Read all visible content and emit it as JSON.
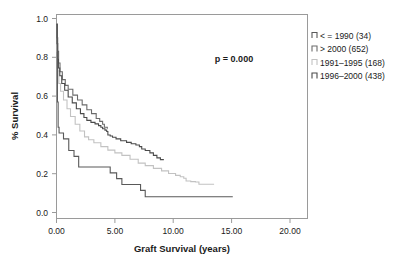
{
  "chart_data": {
    "type": "line",
    "subtype": "kaplan-meier-survival",
    "title": "",
    "xlabel": "Graft Survival (years)",
    "ylabel": "% Survival",
    "xlim": [
      0,
      21.5
    ],
    "ylim": [
      0,
      1.05
    ],
    "xticks": [
      0,
      5,
      10,
      15,
      20
    ],
    "xtick_labels": [
      "0.00",
      "5.00",
      "10.00",
      "15.00",
      "20.00"
    ],
    "yticks": [
      0.0,
      0.2,
      0.4,
      0.6,
      0.8,
      1.0
    ],
    "ytick_labels": [
      "0.0",
      "0.2",
      "0.4",
      "0.6",
      "0.8",
      "1.0"
    ],
    "grid": false,
    "legend_position": "right-outside",
    "annotations": [
      {
        "name": "p-value",
        "text": "p = 0.000",
        "x": 11.0,
        "y": 0.8
      }
    ],
    "series": [
      {
        "name": "<= 1990 (34)",
        "label": "< = 1990 (34)",
        "group": "<= 1990",
        "n": 34,
        "color": "#595959",
        "points": [
          [
            0.0,
            1.0
          ],
          [
            0.08,
            0.6
          ],
          [
            0.14,
            0.47
          ],
          [
            0.22,
            0.44
          ],
          [
            0.55,
            0.44
          ],
          [
            0.6,
            0.41
          ],
          [
            1.0,
            0.41
          ],
          [
            1.05,
            0.35
          ],
          [
            1.45,
            0.35
          ],
          [
            1.5,
            0.32
          ],
          [
            1.85,
            0.32
          ],
          [
            1.9,
            0.265
          ],
          [
            4.55,
            0.265
          ],
          [
            4.6,
            0.235
          ],
          [
            5.1,
            0.235
          ],
          [
            5.15,
            0.205
          ],
          [
            5.55,
            0.205
          ],
          [
            5.6,
            0.175
          ],
          [
            7.15,
            0.175
          ],
          [
            7.2,
            0.145
          ],
          [
            7.55,
            0.145
          ],
          [
            7.6,
            0.112
          ],
          [
            15.1,
            0.112
          ]
        ]
      },
      {
        "name": "> 2000 (652)",
        "label": "> 2000 (652)",
        "group": "> 2000",
        "n": 652,
        "color": "#6b6b6b",
        "points": [
          [
            0.0,
            1.0
          ],
          [
            0.05,
            0.93
          ],
          [
            0.1,
            0.86
          ],
          [
            0.18,
            0.8
          ],
          [
            0.3,
            0.755
          ],
          [
            0.5,
            0.715
          ],
          [
            0.75,
            0.685
          ],
          [
            1.0,
            0.665
          ],
          [
            1.4,
            0.635
          ],
          [
            1.8,
            0.61
          ],
          [
            2.2,
            0.585
          ],
          [
            2.6,
            0.56
          ],
          [
            3.0,
            0.54
          ],
          [
            3.4,
            0.515
          ],
          [
            3.7,
            0.5
          ],
          [
            3.95,
            0.485
          ],
          [
            4.1,
            0.47
          ],
          [
            4.35,
            0.462
          ]
        ]
      },
      {
        "name": "1991-1995 (168)",
        "label": "1991–1995 (168)",
        "group": "1991-1995",
        "n": 168,
        "color": "#c2c2c2",
        "points": [
          [
            0.0,
            1.0
          ],
          [
            0.06,
            0.86
          ],
          [
            0.12,
            0.76
          ],
          [
            0.2,
            0.695
          ],
          [
            0.35,
            0.655
          ],
          [
            0.6,
            0.61
          ],
          [
            0.9,
            0.565
          ],
          [
            1.2,
            0.525
          ],
          [
            1.6,
            0.485
          ],
          [
            2.0,
            0.45
          ],
          [
            2.4,
            0.42
          ],
          [
            2.75,
            0.405
          ],
          [
            3.2,
            0.39
          ],
          [
            3.8,
            0.37
          ],
          [
            4.4,
            0.352
          ],
          [
            5.0,
            0.338
          ],
          [
            5.6,
            0.325
          ],
          [
            6.3,
            0.305
          ],
          [
            7.0,
            0.285
          ],
          [
            7.6,
            0.272
          ],
          [
            8.3,
            0.258
          ],
          [
            9.0,
            0.245
          ],
          [
            9.6,
            0.232
          ],
          [
            10.2,
            0.222
          ],
          [
            10.6,
            0.215
          ],
          [
            10.9,
            0.207
          ],
          [
            11.1,
            0.193
          ],
          [
            11.5,
            0.19
          ],
          [
            11.9,
            0.188
          ],
          [
            12.2,
            0.176
          ],
          [
            13.5,
            0.176
          ]
        ]
      },
      {
        "name": "1996-2000 (438)",
        "label": "1996–2000 (438)",
        "group": "1996-2000",
        "n": 438,
        "color": "#4a4a4a",
        "points": [
          [
            0.0,
            1.0
          ],
          [
            0.05,
            0.9
          ],
          [
            0.1,
            0.82
          ],
          [
            0.16,
            0.775
          ],
          [
            0.28,
            0.735
          ],
          [
            0.45,
            0.695
          ],
          [
            0.7,
            0.66
          ],
          [
            1.0,
            0.625
          ],
          [
            1.35,
            0.595
          ],
          [
            1.7,
            0.565
          ],
          [
            2.05,
            0.54
          ],
          [
            2.35,
            0.52
          ],
          [
            2.6,
            0.505
          ],
          [
            2.95,
            0.495
          ],
          [
            3.3,
            0.487
          ],
          [
            3.6,
            0.478
          ],
          [
            3.8,
            0.47
          ],
          [
            3.95,
            0.462
          ],
          [
            4.15,
            0.455
          ],
          [
            4.3,
            0.448
          ],
          [
            4.4,
            0.43
          ],
          [
            4.6,
            0.425
          ],
          [
            4.8,
            0.418
          ],
          [
            5.1,
            0.41
          ],
          [
            5.5,
            0.4
          ],
          [
            6.0,
            0.392
          ],
          [
            6.4,
            0.385
          ],
          [
            6.8,
            0.378
          ],
          [
            7.1,
            0.37
          ],
          [
            7.3,
            0.358
          ],
          [
            7.6,
            0.35
          ],
          [
            8.0,
            0.338
          ],
          [
            8.3,
            0.325
          ],
          [
            8.6,
            0.312
          ],
          [
            8.9,
            0.303
          ],
          [
            9.15,
            0.3
          ]
        ]
      }
    ],
    "legend_order": [
      "<= 1990 (34)",
      "> 2000 (652)",
      "1991-1995 (168)",
      "1996-2000 (438)"
    ]
  },
  "legend": {
    "entries": [
      {
        "label": "< = 1990 (34)",
        "color": "#595959"
      },
      {
        "label": "> 2000 (652)",
        "color": "#6b6b6b"
      },
      {
        "label": "1991–1995 (168)",
        "color": "#c2c2c2"
      },
      {
        "label": "1996–2000 (438)",
        "color": "#4a4a4a"
      }
    ]
  },
  "axes": {
    "x_title": "Graft Survival (years)",
    "y_title": "% Survival",
    "x_labels": [
      "0.00",
      "5.00",
      "10.00",
      "15.00",
      "20.00"
    ],
    "y_labels": [
      "0.0",
      "0.2",
      "0.4",
      "0.6",
      "0.8",
      "1.0"
    ]
  },
  "stats": {
    "p_value_text": "p = 0.000"
  }
}
